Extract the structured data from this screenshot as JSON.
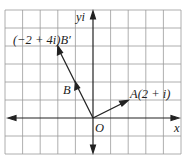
{
  "diagram": {
    "type": "complex-plane-vectors",
    "grid": {
      "cols": 10,
      "rows": 8,
      "cell_px": 17.6,
      "origin_col": 5,
      "origin_row": 6
    },
    "axes": {
      "x_label": "x",
      "y_label": "yi",
      "origin_label": "O"
    },
    "points": [
      {
        "name": "A",
        "label": "A(2 + i)",
        "re": 2,
        "im": 1
      },
      {
        "name": "B",
        "label": "B",
        "re": -1,
        "im": 2
      },
      {
        "name": "B'",
        "label": "(−2 + 4i)B′",
        "re": -2,
        "im": 4
      }
    ],
    "vectors": [
      {
        "from": "O",
        "to": "A"
      },
      {
        "from": "O",
        "to": "B'",
        "midpoint_arrow": "B"
      }
    ],
    "colors": {
      "grid": "#9a9a9a",
      "axis": "#222222",
      "vector": "#222222"
    }
  },
  "labels": {
    "y_axis": "yi",
    "x_axis": "x",
    "origin": "O",
    "point_a": "A(2 + i)",
    "point_b": "B",
    "point_b_prime": "(−2 + 4i)B′"
  }
}
